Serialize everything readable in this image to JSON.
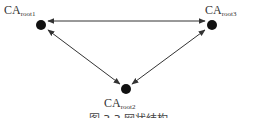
{
  "nodes": [
    {
      "id": "root1",
      "label_main": "CA",
      "label_sub": "root1"
    },
    {
      "id": "root2",
      "label_main": "CA",
      "label_sub": "root2"
    },
    {
      "id": "root3",
      "label_main": "CA",
      "label_sub": "root3"
    }
  ],
  "edges": [
    {
      "from": "root1",
      "to": "root3",
      "direction": "bidirectional"
    },
    {
      "from": "root1",
      "to": "root2",
      "direction": "bidirectional"
    },
    {
      "from": "root3",
      "to": "root2",
      "direction": "bidirectional"
    }
  ],
  "caption": "图 3.3  网状结构",
  "colors": {
    "node": "#111111",
    "edge": "#333333",
    "text": "#333333"
  }
}
